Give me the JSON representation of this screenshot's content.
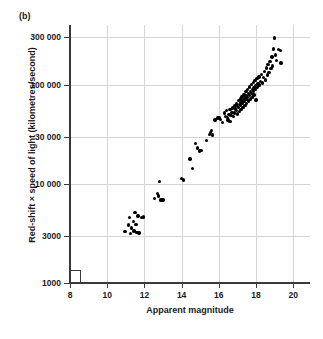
{
  "figure": {
    "panel_label": "(b)",
    "background_color": "#ffffff",
    "point_color": "#000000",
    "grid_color": "#d4d4d4",
    "axis_color": "#3a3a3a"
  },
  "chart_data": {
    "type": "scatter",
    "title": "",
    "panel": "(b)",
    "xlabel": "Apparent magnitude",
    "ylabel": "Red-shift × speed of light (kilometres/second)",
    "xlim": [
      8,
      20.9
    ],
    "ylim": [
      1000,
      400000
    ],
    "xscale": "linear",
    "yscale": "log",
    "grid": true,
    "legend": null,
    "xticks": [
      8,
      10,
      12,
      14,
      16,
      18,
      20
    ],
    "xtick_labels": [
      "8",
      "10",
      "12",
      "14",
      "16",
      "18",
      "20"
    ],
    "yticks": [
      1000,
      3000,
      10000,
      30000,
      100000,
      300000
    ],
    "ytick_labels": [
      "1000",
      "3000",
      "10 000",
      "30 000",
      "100 000",
      "300 000"
    ],
    "axis_break": true,
    "n_points": 124,
    "points": [
      [
        10.95,
        3300
      ],
      [
        11.15,
        3850
      ],
      [
        11.2,
        4550
      ],
      [
        11.25,
        3150
      ],
      [
        11.3,
        3600
      ],
      [
        11.4,
        4200
      ],
      [
        11.45,
        3350
      ],
      [
        11.5,
        5150
      ],
      [
        11.55,
        3900
      ],
      [
        11.6,
        3250
      ],
      [
        11.65,
        4750
      ],
      [
        11.7,
        3200
      ],
      [
        11.85,
        4600
      ],
      [
        11.95,
        4650
      ],
      [
        12.55,
        7100
      ],
      [
        12.7,
        8000
      ],
      [
        12.75,
        7550
      ],
      [
        12.8,
        10600
      ],
      [
        12.85,
        6900
      ],
      [
        12.95,
        6850
      ],
      [
        13.0,
        6850
      ],
      [
        14.0,
        11400
      ],
      [
        14.1,
        10900
      ],
      [
        14.45,
        17800
      ],
      [
        14.6,
        14300
      ],
      [
        14.75,
        25500
      ],
      [
        14.85,
        23000
      ],
      [
        14.95,
        21500
      ],
      [
        15.05,
        21700
      ],
      [
        15.35,
        27500
      ],
      [
        15.5,
        31500
      ],
      [
        15.55,
        32800
      ],
      [
        15.6,
        34500
      ],
      [
        15.65,
        31000
      ],
      [
        15.8,
        44000
      ],
      [
        15.95,
        46000
      ],
      [
        16.0,
        47000
      ],
      [
        16.05,
        45500
      ],
      [
        16.1,
        44500
      ],
      [
        16.2,
        41500
      ],
      [
        16.3,
        52000
      ],
      [
        16.35,
        48000
      ],
      [
        16.4,
        55000
      ],
      [
        16.45,
        46500
      ],
      [
        16.5,
        44000
      ],
      [
        16.55,
        50000
      ],
      [
        16.6,
        42500
      ],
      [
        16.6,
        56000
      ],
      [
        16.65,
        49000
      ],
      [
        16.7,
        52500
      ],
      [
        16.75,
        58000
      ],
      [
        16.8,
        47500
      ],
      [
        16.85,
        61000
      ],
      [
        16.85,
        52000
      ],
      [
        16.9,
        57000
      ],
      [
        16.95,
        64000
      ],
      [
        16.95,
        55000
      ],
      [
        17.0,
        60000
      ],
      [
        17.0,
        50500
      ],
      [
        17.05,
        69000
      ],
      [
        17.05,
        58500
      ],
      [
        17.1,
        63000
      ],
      [
        17.1,
        54000
      ],
      [
        17.15,
        72000
      ],
      [
        17.15,
        61500
      ],
      [
        17.2,
        66000
      ],
      [
        17.2,
        56500
      ],
      [
        17.25,
        76000
      ],
      [
        17.25,
        64500
      ],
      [
        17.3,
        70000
      ],
      [
        17.3,
        59000
      ],
      [
        17.35,
        80000
      ],
      [
        17.35,
        67500
      ],
      [
        17.4,
        73500
      ],
      [
        17.4,
        62000
      ],
      [
        17.45,
        85000
      ],
      [
        17.45,
        71000
      ],
      [
        17.5,
        77000
      ],
      [
        17.5,
        65000
      ],
      [
        17.55,
        90000
      ],
      [
        17.55,
        74500
      ],
      [
        17.6,
        81000
      ],
      [
        17.6,
        68500
      ],
      [
        17.65,
        95000
      ],
      [
        17.65,
        78000
      ],
      [
        17.7,
        85000
      ],
      [
        17.7,
        72000
      ],
      [
        17.75,
        100000
      ],
      [
        17.75,
        82000
      ],
      [
        17.8,
        89000
      ],
      [
        17.8,
        75500
      ],
      [
        17.85,
        105000
      ],
      [
        17.85,
        86000
      ],
      [
        17.9,
        93000
      ],
      [
        17.9,
        79000
      ],
      [
        17.95,
        110000
      ],
      [
        17.95,
        90000
      ],
      [
        18.0,
        97000
      ],
      [
        18.0,
        70000
      ],
      [
        18.05,
        115000
      ],
      [
        18.05,
        95000
      ],
      [
        18.1,
        102000
      ],
      [
        18.15,
        120000
      ],
      [
        18.2,
        99000
      ],
      [
        18.25,
        108000
      ],
      [
        18.3,
        127000
      ],
      [
        18.35,
        104000
      ],
      [
        18.4,
        118000
      ],
      [
        18.45,
        135000
      ],
      [
        18.5,
        112000
      ],
      [
        18.55,
        148000
      ],
      [
        18.6,
        125000
      ],
      [
        18.65,
        160000
      ],
      [
        18.7,
        132000
      ],
      [
        18.75,
        172000
      ],
      [
        18.8,
        145000
      ],
      [
        18.85,
        190000
      ],
      [
        18.9,
        155000
      ],
      [
        18.95,
        230000
      ],
      [
        19.0,
        295000
      ],
      [
        19.05,
        200000
      ],
      [
        19.1,
        175000
      ],
      [
        19.2,
        225000
      ],
      [
        19.3,
        220000
      ],
      [
        19.35,
        165000
      ]
    ]
  }
}
